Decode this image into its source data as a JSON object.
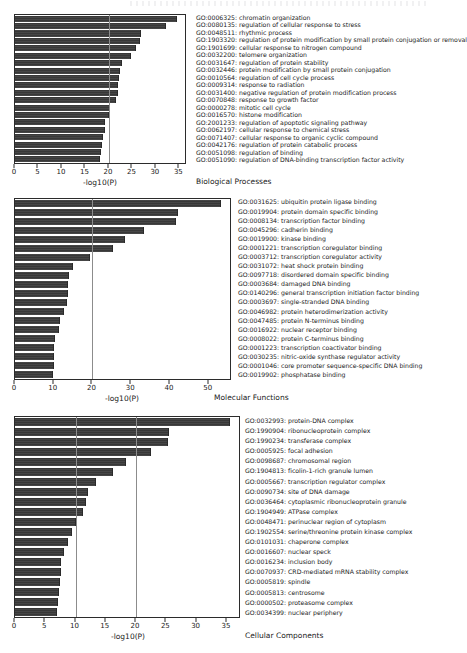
{
  "figure": {
    "xlabel": "-log10(P)",
    "panels": [
      {
        "key": "bp",
        "caption": "Biological Processes",
        "xlabel": "-log10(P)",
        "xmin": 0,
        "xmax": 36.2,
        "ticks": [
          0,
          5,
          10,
          15,
          20,
          25,
          30,
          35
        ],
        "gridlines": [
          20
        ],
        "terms": [
          {
            "id": "GO:0006325",
            "name": "chromatin organization",
            "value": 34.6
          },
          {
            "id": "GO:0080135",
            "name": "regulation of cellular response to stress",
            "value": 32.2
          },
          {
            "id": "GO:0048511",
            "name": "rhythmic process",
            "value": 26.9
          },
          {
            "id": "GO:1903320",
            "name": "regulation of protein modification by small protein conjugation or removal",
            "value": 26.6
          },
          {
            "id": "GO:1901699",
            "name": "cellular response to nitrogen compound",
            "value": 25.8
          },
          {
            "id": "GO:0032200",
            "name": "telomere organization",
            "value": 24.7
          },
          {
            "id": "GO:0031647",
            "name": "regulation of protein stability",
            "value": 22.8
          },
          {
            "id": "GO:0032446",
            "name": "protein modification by small protein conjugation",
            "value": 22.4
          },
          {
            "id": "GO:0010564",
            "name": "regulation of cell cycle process",
            "value": 22.1
          },
          {
            "id": "GO:0009314",
            "name": "response to radiation",
            "value": 22.0
          },
          {
            "id": "GO:0031400",
            "name": "negative regulation of protein modification process",
            "value": 21.9
          },
          {
            "id": "GO:0070848",
            "name": "response to growth factor",
            "value": 21.5
          },
          {
            "id": "GO:0000278",
            "name": "mitotic cell cycle",
            "value": 20.2
          },
          {
            "id": "GO:0016570",
            "name": "histone modification",
            "value": 20.0
          },
          {
            "id": "GO:2001233",
            "name": "regulation of apoptotic signaling pathway",
            "value": 19.2
          },
          {
            "id": "GO:0062197",
            "name": "cellular response to chemical stress",
            "value": 19.1
          },
          {
            "id": "GO:0071407",
            "name": "cellular response to organic cyclic compound",
            "value": 18.8
          },
          {
            "id": "GO:0042176",
            "name": "regulation of protein catabolic process",
            "value": 18.6
          },
          {
            "id": "GO:0051098",
            "name": "regulation of binding",
            "value": 18.4
          },
          {
            "id": "GO:0051090",
            "name": "regulation of DNA-binding transcription factor activity",
            "value": 18.2
          }
        ]
      },
      {
        "key": "mf",
        "caption": "Molecular Functions",
        "xlabel": "-log10(P)",
        "xmin": 0,
        "xmax": 55.5,
        "ticks": [
          0,
          10,
          20,
          30,
          40,
          50
        ],
        "gridlines": [
          20
        ],
        "terms": [
          {
            "id": "GO:0031625",
            "name": "ubiquitin protein ligase binding",
            "value": 53.2
          },
          {
            "id": "GO:0019904",
            "name": "protein domain specific binding",
            "value": 42.0
          },
          {
            "id": "GO:0008134",
            "name": "transcription factor binding",
            "value": 41.5
          },
          {
            "id": "GO:0045296",
            "name": "cadherin binding",
            "value": 33.4
          },
          {
            "id": "GO:0019900",
            "name": "kinase binding",
            "value": 28.5
          },
          {
            "id": "GO:0001221",
            "name": "transcription coregulator binding",
            "value": 25.3
          },
          {
            "id": "GO:0003712",
            "name": "transcription coregulator activity",
            "value": 19.3
          },
          {
            "id": "GO:0031072",
            "name": "heat shock protein binding",
            "value": 14.9
          },
          {
            "id": "GO:0097718",
            "name": "disordered domain specific binding",
            "value": 14.0
          },
          {
            "id": "GO:0003684",
            "name": "damaged DNA binding",
            "value": 13.7
          },
          {
            "id": "GO:0140296",
            "name": "general transcription initiation factor binding",
            "value": 13.6
          },
          {
            "id": "GO:0003697",
            "name": "single-stranded DNA binding",
            "value": 13.5
          },
          {
            "id": "GO:0046982",
            "name": "protein heterodimerization activity",
            "value": 12.6
          },
          {
            "id": "GO:0047485",
            "name": "protein N-terminus binding",
            "value": 11.7
          },
          {
            "id": "GO:0016922",
            "name": "nuclear receptor binding",
            "value": 11.4
          },
          {
            "id": "GO:0008022",
            "name": "protein C-terminus binding",
            "value": 10.2
          },
          {
            "id": "GO:0001223",
            "name": "transcription coactivator binding",
            "value": 10.1
          },
          {
            "id": "GO:0030235",
            "name": "nitric-oxide synthase regulator activity",
            "value": 10.0
          },
          {
            "id": "GO:0001046",
            "name": "core promoter sequence-specific DNA binding",
            "value": 10.0
          },
          {
            "id": "GO:0019902",
            "name": "phosphatase binding",
            "value": 9.9
          }
        ]
      },
      {
        "key": "cc",
        "caption": "Cellular Components",
        "xlabel": "-log10(P)",
        "xmin": 0,
        "xmax": 37.0,
        "ticks": [
          0,
          5,
          10,
          15,
          20,
          25,
          30,
          35
        ],
        "gridlines": [
          10,
          20
        ],
        "terms": [
          {
            "id": "GO:0032993",
            "name": "protein-DNA complex",
            "value": 35.5
          },
          {
            "id": "GO:1990904",
            "name": "ribonucleoprotein complex",
            "value": 25.5
          },
          {
            "id": "GO:1990234",
            "name": "transferase complex",
            "value": 25.3
          },
          {
            "id": "GO:0005925",
            "name": "focal adhesion",
            "value": 22.4
          },
          {
            "id": "GO:0098687",
            "name": "chromosomal region",
            "value": 18.3
          },
          {
            "id": "GO:1904813",
            "name": "ficolin-1-rich granule lumen",
            "value": 16.2
          },
          {
            "id": "GO:0005667",
            "name": "transcription regulator complex",
            "value": 13.3
          },
          {
            "id": "GO:0090734",
            "name": "site of DNA damage",
            "value": 12.1
          },
          {
            "id": "GO:0036464",
            "name": "cytoplasmic ribonucleoprotein granule",
            "value": 11.7
          },
          {
            "id": "GO:1904949",
            "name": "ATPase complex",
            "value": 11.2
          },
          {
            "id": "GO:0048471",
            "name": "perinuclear region of cytoplasm",
            "value": 10.0
          },
          {
            "id": "GO:1902554",
            "name": "serine/threonine protein kinase complex",
            "value": 9.4
          },
          {
            "id": "GO:0101031",
            "name": "chaperone complex",
            "value": 8.8
          },
          {
            "id": "GO:0016607",
            "name": "nuclear speck",
            "value": 8.1
          },
          {
            "id": "GO:0016234",
            "name": "inclusion body",
            "value": 7.6
          },
          {
            "id": "GO:0070937",
            "name": "CRD-mediated mRNA stability complex",
            "value": 7.6
          },
          {
            "id": "GO:0005819",
            "name": "spindle",
            "value": 7.4
          },
          {
            "id": "GO:0005813",
            "name": "centrosome",
            "value": 7.2
          },
          {
            "id": "GO:0000502",
            "name": "proteasome complex",
            "value": 7.1
          },
          {
            "id": "GO:0034399",
            "name": "nuclear periphery",
            "value": 6.9
          }
        ]
      }
    ]
  },
  "style": {
    "bar_color": "#3b3b3b",
    "frame_color": "#2b2b2b",
    "grid_color": "#8c8c8c",
    "text_color": "#1a1a1a"
  }
}
